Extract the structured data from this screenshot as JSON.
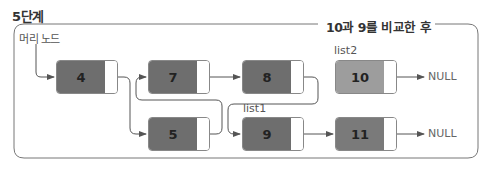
{
  "step_title": "5단계",
  "frame_title": "10과 9를 비교한 후",
  "head_label": "머리 노드",
  "labels": {
    "list1": "list1",
    "list2": "list2",
    "null": "NULL"
  },
  "colors": {
    "node_dark": "#6e6e6e",
    "node_mid": "#7a7a7a",
    "node_light": "#9d9d9d",
    "line": "#555555",
    "frame": "#777777"
  },
  "nodes": [
    {
      "id": "n4",
      "value": "4"
    },
    {
      "id": "n7",
      "value": "7"
    },
    {
      "id": "n8",
      "value": "8"
    },
    {
      "id": "n10",
      "value": "10"
    },
    {
      "id": "n5",
      "value": "5"
    },
    {
      "id": "n9",
      "value": "9"
    },
    {
      "id": "n11",
      "value": "11"
    }
  ],
  "links": [
    {
      "from": "head",
      "to": "4"
    },
    {
      "from": "4",
      "to": "5"
    },
    {
      "from": "5",
      "to": "7"
    },
    {
      "from": "7",
      "to": "8"
    },
    {
      "from": "8",
      "to": "9"
    },
    {
      "from": "9",
      "to": "11"
    },
    {
      "from": "11",
      "to": "NULL"
    },
    {
      "from": "10",
      "to": "NULL"
    }
  ]
}
